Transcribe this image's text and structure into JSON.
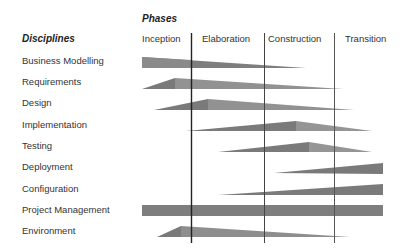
{
  "header": {
    "phases_title": "Phases",
    "disciplines_title": "Disciplines"
  },
  "phases": [
    {
      "label": "Inception",
      "x": 142
    },
    {
      "label": "Elaboration",
      "x": 202
    },
    {
      "label": "Construction",
      "x": 268
    },
    {
      "label": "Transition",
      "x": 345
    }
  ],
  "disciplines": [
    {
      "label": "Business Modelling",
      "y": 55
    },
    {
      "label": "Requirements",
      "y": 76
    },
    {
      "label": "Design",
      "y": 97
    },
    {
      "label": "Implementation",
      "y": 119
    },
    {
      "label": "Testing",
      "y": 140
    },
    {
      "label": "Deployment",
      "y": 161
    },
    {
      "label": "Configuration",
      "y": 183
    },
    {
      "label": "Project Management",
      "y": 204
    },
    {
      "label": "Environment",
      "y": 225
    }
  ],
  "phase_dividers_x": [
    191,
    264,
    334
  ],
  "colors": {
    "bar_dark": "#7a7a7a",
    "bar_light": "#9a9a9a",
    "divider": "#333333"
  }
}
